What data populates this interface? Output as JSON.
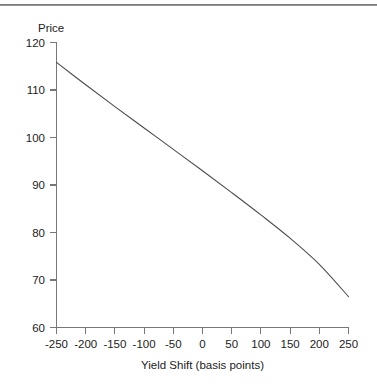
{
  "figure": {
    "background_color": "#ffffff",
    "top_rule": true,
    "top_rule_color": "#6f6f6f"
  },
  "chart_data": {
    "type": "line",
    "title": "",
    "subtitle": "",
    "xlabel": "Yield Shift (basis points)",
    "ylabel": "Price",
    "ylabel_position": "top-left-horizontal",
    "xlim": [
      -250,
      250
    ],
    "ylim": [
      60,
      120
    ],
    "xticks": [
      -250,
      -200,
      -150,
      -100,
      -50,
      0,
      50,
      100,
      150,
      200,
      250
    ],
    "xtick_labels": [
      "-250",
      "-200",
      "-150",
      "-100",
      "-50",
      "0",
      "50",
      "100",
      "150",
      "200",
      "250"
    ],
    "yticks": [
      60,
      70,
      80,
      90,
      100,
      110,
      120
    ],
    "ytick_labels": [
      "60",
      "70",
      "80",
      "90",
      "100",
      "110",
      "120"
    ],
    "grid": false,
    "legend": false,
    "legend_position": "none",
    "line_color": "#4a4a4a",
    "series": [
      {
        "name": "Price",
        "x": [
          -250,
          -200,
          -150,
          -100,
          -50,
          0,
          50,
          100,
          150,
          200,
          250
        ],
        "values": [
          115.8,
          111.1,
          106.5,
          102.0,
          97.5,
          93.0,
          88.4,
          83.7,
          78.8,
          73.3,
          66.5
        ]
      }
    ]
  },
  "axes": {
    "y_axis_title": "Price",
    "x_axis_title": "Yield Shift (basis points)"
  }
}
